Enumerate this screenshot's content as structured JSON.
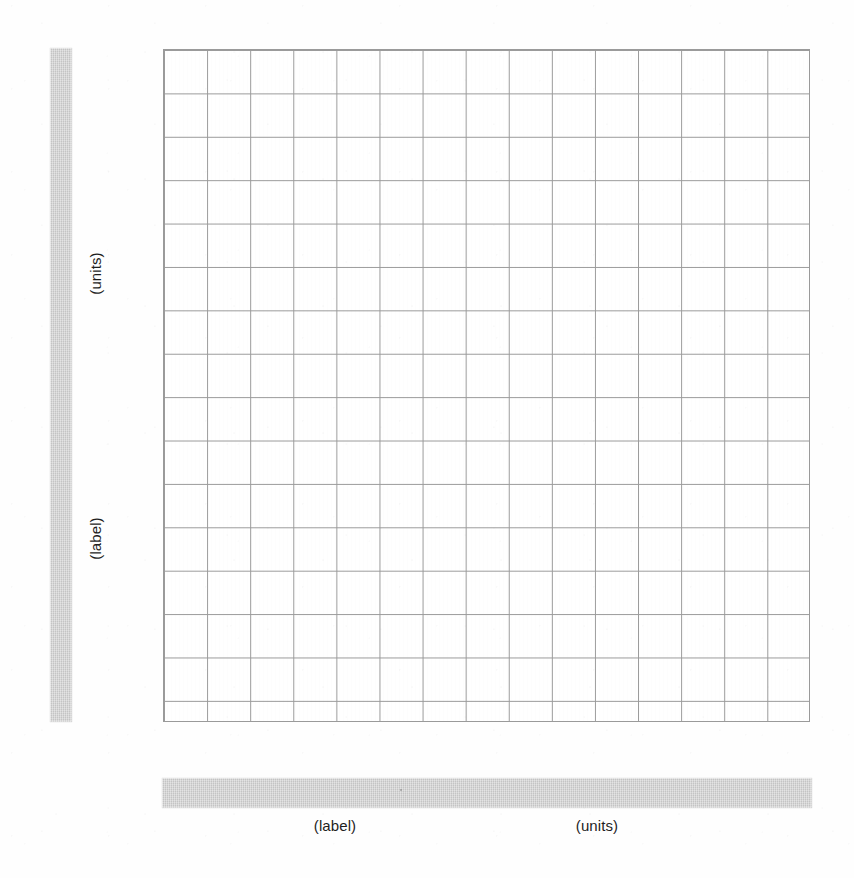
{
  "document": {
    "type": "blank-graph-paper-worksheet",
    "background_color": "#fefefe",
    "grid_line_color": "#9a9a9a",
    "band_color": "#d2d2d2",
    "text_color": "#1e1e1e"
  },
  "y_axis": {
    "band": {
      "name": "vertical-label-band",
      "x": 50,
      "y": 48,
      "width": 22,
      "height": 674,
      "color": "#d2d2d2"
    },
    "units_label": "(units)",
    "name_label": "(label)"
  },
  "x_axis": {
    "band": {
      "name": "horizontal-label-band",
      "x": 162,
      "y": 778,
      "width": 650,
      "height": 30,
      "color": "#d2d2d2"
    },
    "name_label": "(label)",
    "units_label": "(units)"
  },
  "chart_data": {
    "type": "scatter",
    "title": "",
    "subtitle": "",
    "xlabel": "(label)",
    "xunits": "(units)",
    "ylabel": "(label)",
    "yunits": "(units)",
    "grid": true,
    "grid_columns": 15,
    "grid_rows": 16,
    "cell_width_px": 43.1,
    "cell_height_px": 43.4,
    "plot_left_px": 163,
    "plot_top_px": 49,
    "plot_width_px": 647,
    "plot_height_px": 673,
    "xlim": [
      0,
      15
    ],
    "ylim": [
      0,
      16
    ],
    "xticks": [],
    "yticks": [],
    "tick_labels_shown": false,
    "legend": null,
    "legend_position": "none",
    "series": [],
    "annotations": [],
    "note": "Blank graph-paper plotting grid; axis name and unit fields are left empty for the reader to fill in."
  }
}
